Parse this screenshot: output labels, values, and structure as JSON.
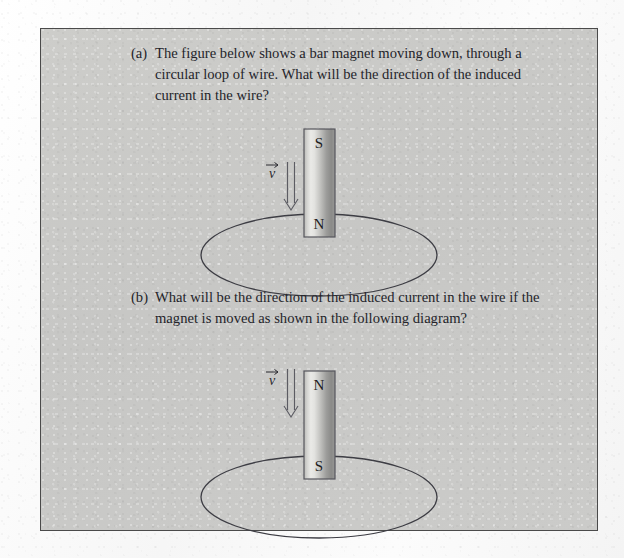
{
  "figure": {
    "background_color": "#c9c9c7",
    "border_color": "#4a4a4a",
    "page_color": "#fbfbfb"
  },
  "questions": [
    {
      "label": "(a)",
      "text": "The figure below shows a bar magnet moving down, through a circular loop of wire. What will be the direction of the induced current in the wire?"
    },
    {
      "label": "(b)",
      "text": "What will be the direction of the induced current in the wire if the magnet is moved as shown in the following diagram?"
    }
  ],
  "diagrams": [
    {
      "name": "diagram-a",
      "magnet": {
        "top_pole": "S",
        "bottom_pole": "N",
        "orientation": "vertical"
      },
      "velocity": {
        "symbol": "v",
        "direction": "down"
      },
      "loop": {
        "shape": "ellipse",
        "label": "circular loop of wire"
      }
    },
    {
      "name": "diagram-b",
      "magnet": {
        "top_pole": "N",
        "bottom_pole": "S",
        "orientation": "vertical"
      },
      "velocity": {
        "symbol": "v",
        "direction": "down"
      },
      "loop": {
        "shape": "ellipse",
        "label": "circular loop of wire"
      }
    }
  ]
}
